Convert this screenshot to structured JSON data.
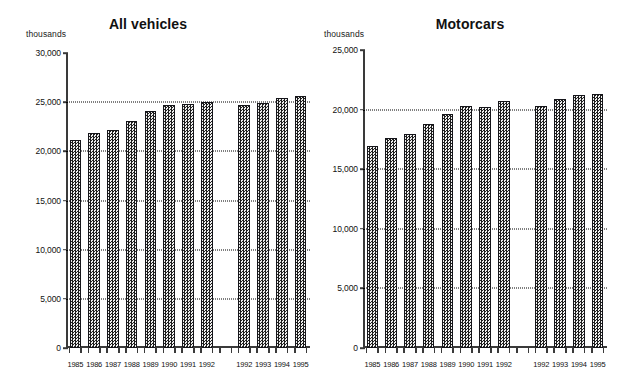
{
  "figure": {
    "background": "#ffffff",
    "bar_fill": "#8d8d8d",
    "bar_border": "#15151a",
    "axis_color": "#3a3a3a",
    "grid_color": "#000000"
  },
  "panels": [
    {
      "id": "all-vehicles",
      "title": "All vehicles",
      "units": "thousands"
    },
    {
      "id": "motorcars",
      "title": "Motorcars",
      "units": "thousands"
    }
  ],
  "chart_data": [
    {
      "type": "bar",
      "title": "All vehicles",
      "xlabel": "",
      "ylabel": "thousands",
      "ylim": [
        0,
        30000
      ],
      "yticks": [
        0,
        5000,
        10000,
        15000,
        20000,
        25000,
        30000
      ],
      "ytick_labels": [
        "0",
        "5,000",
        "10,000",
        "15,000",
        "20,000",
        "25,000",
        "30,000"
      ],
      "grid": true,
      "gridlines": [
        5000,
        10000,
        15000,
        20000,
        25000
      ],
      "legend": "none",
      "categories": [
        "1985",
        "1986",
        "1987",
        "1988",
        "1989",
        "1990",
        "1991",
        "1992",
        "",
        "1992",
        "1993",
        "1994",
        "1995"
      ],
      "values": [
        21150,
        21860,
        22170,
        23090,
        24100,
        24710,
        24810,
        25020,
        null,
        24710,
        24910,
        25420,
        25630
      ],
      "groups": [
        {
          "name": "first-series",
          "categories": [
            "1985",
            "1986",
            "1987",
            "1988",
            "1989",
            "1990",
            "1991",
            "1992"
          ],
          "values": [
            21150,
            21860,
            22170,
            23090,
            24100,
            24710,
            24810,
            25020
          ]
        },
        {
          "name": "second-series",
          "categories": [
            "1992",
            "1993",
            "1994",
            "1995"
          ],
          "values": [
            24710,
            24910,
            25420,
            25630
          ]
        }
      ]
    },
    {
      "type": "bar",
      "title": "Motorcars",
      "xlabel": "",
      "ylabel": "thousands",
      "ylim": [
        0,
        25000
      ],
      "yticks": [
        0,
        5000,
        10000,
        15000,
        20000,
        25000
      ],
      "ytick_labels": [
        "0",
        "5,000",
        "10,000",
        "15,000",
        "20,000",
        "25,000"
      ],
      "grid": true,
      "gridlines": [
        5000,
        10000,
        15000,
        20000
      ],
      "legend": "none",
      "categories": [
        "1985",
        "1986",
        "1987",
        "1988",
        "1989",
        "1990",
        "1991",
        "1992",
        "",
        "1992",
        "1993",
        "1994",
        "1995"
      ],
      "values": [
        16950,
        17620,
        17950,
        18790,
        19630,
        20300,
        20220,
        20720,
        null,
        20300,
        20890,
        21230,
        21310
      ],
      "groups": [
        {
          "name": "first-series",
          "categories": [
            "1985",
            "1986",
            "1987",
            "1988",
            "1989",
            "1990",
            "1991",
            "1992"
          ],
          "values": [
            16950,
            17620,
            17950,
            18790,
            19630,
            20300,
            20220,
            20720
          ]
        },
        {
          "name": "second-series",
          "categories": [
            "1992",
            "1993",
            "1994",
            "1995"
          ],
          "values": [
            20300,
            20890,
            21230,
            21310
          ]
        }
      ]
    }
  ]
}
